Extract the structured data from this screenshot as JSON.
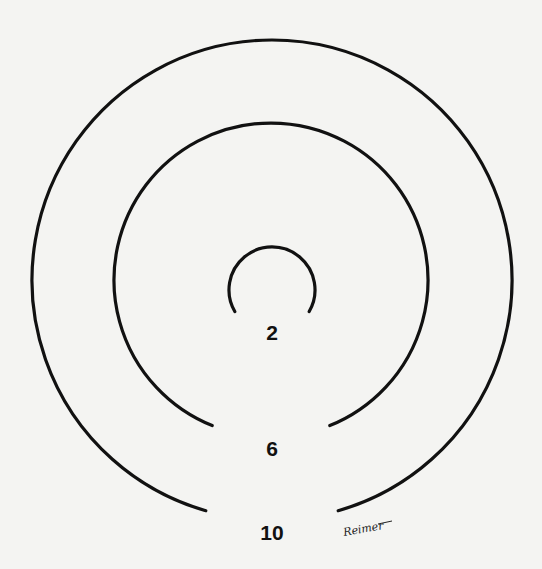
{
  "diagram": {
    "type": "concentric-rings",
    "rings": [
      {
        "label": "2",
        "cx": 272,
        "cy": 290,
        "r": 43,
        "gap_deg": 60
      },
      {
        "label": "6",
        "cx": 271,
        "cy": 280,
        "r": 157,
        "gap_deg": 22
      },
      {
        "label": "10",
        "cx": 272,
        "cy": 280,
        "r": 240,
        "gap_deg": 16
      }
    ],
    "signature": "Reimer",
    "colors": {
      "background": "#f4f4f2",
      "stroke": "#111111"
    }
  }
}
